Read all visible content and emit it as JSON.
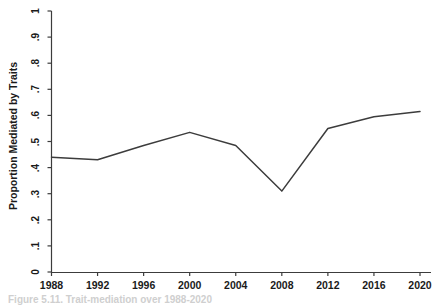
{
  "chart_data": {
    "type": "line",
    "title": "",
    "xlabel": "",
    "ylabel": "Proportion Mediated by Traits",
    "x": [
      1988,
      1992,
      1996,
      2000,
      2004,
      2008,
      2012,
      2016,
      2020
    ],
    "xtick_labels": [
      "1988",
      "1992",
      "1996",
      "2000",
      "2004",
      "2008",
      "2012",
      "2016",
      "2020"
    ],
    "ytick_labels": [
      "0",
      ".1",
      ".2",
      ".3",
      ".4",
      ".5",
      ".6",
      ".7",
      ".8",
      ".9",
      "1"
    ],
    "ytick_values": [
      0,
      0.1,
      0.2,
      0.3,
      0.4,
      0.5,
      0.6,
      0.7,
      0.8,
      0.9,
      1
    ],
    "xlim": [
      1988,
      2020
    ],
    "ylim": [
      0,
      1
    ],
    "grid": false,
    "legend": false,
    "series": [
      {
        "name": "Proportion Mediated by Traits",
        "color": "#3c3c3c",
        "values": [
          0.44,
          0.43,
          0.485,
          0.535,
          0.485,
          0.31,
          0.55,
          0.595,
          0.615
        ]
      }
    ]
  },
  "caption": {
    "text": "Figure 5.11. Trait-mediation over 1988-2020"
  }
}
